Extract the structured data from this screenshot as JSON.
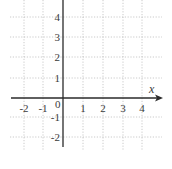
{
  "chart_data": {
    "type": "line",
    "title": "",
    "xlabel": "x",
    "ylabel": "",
    "xlim": [
      -2.5,
      5
    ],
    "ylim": [
      -2.5,
      5
    ],
    "grid": true,
    "x_ticks": [
      -2,
      -1,
      1,
      2,
      3,
      4
    ],
    "y_ticks": [
      4,
      3,
      2,
      1,
      -1,
      -2
    ],
    "origin_label": "0",
    "x_tick_labels": [
      "-2",
      "-1",
      "1",
      "2",
      "3",
      "4"
    ],
    "y_tick_labels": [
      "4",
      "3",
      "2",
      "1",
      "-1",
      "-2"
    ],
    "series": []
  },
  "layout": {
    "origin_px": [
      63,
      98
    ],
    "unit_px": 20,
    "grid_x_px": [
      24,
      43,
      83,
      103,
      123,
      142
    ],
    "grid_y_px": [
      17,
      37,
      57,
      78,
      117,
      137
    ],
    "colors": {
      "axis": "#2a2a2a",
      "grid": "#bdbdbd",
      "text": "#3a3a3a"
    }
  }
}
